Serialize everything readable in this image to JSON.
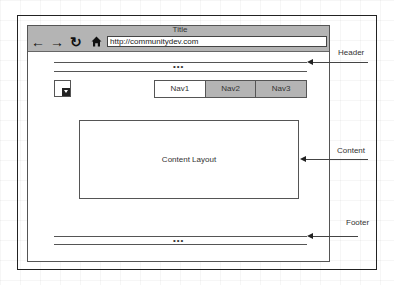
{
  "browser": {
    "title": "Title",
    "url": "http://communitydev.com",
    "icons": {
      "back": "←",
      "forward": "→",
      "reload": "↻",
      "home": "⌂"
    }
  },
  "header": {
    "dots": "•••"
  },
  "nav": {
    "items": [
      {
        "label": "Nav1",
        "state": "active"
      },
      {
        "label": "Nav2",
        "state": "inactive"
      },
      {
        "label": "Nav3",
        "state": "inactive"
      }
    ]
  },
  "content": {
    "label": "Content Layout"
  },
  "footer": {
    "dots": "•••"
  },
  "annotations": {
    "header": "Header",
    "content": "Content",
    "footer": "Footer"
  },
  "colors": {
    "toolbar_gray": "#b4b4b4",
    "inactive_nav": "#b4b4b4",
    "line": "#555555"
  }
}
